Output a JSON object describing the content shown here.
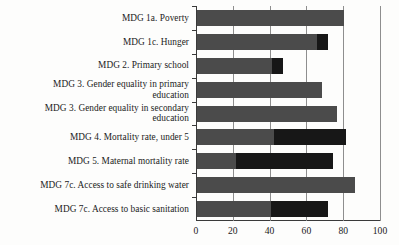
{
  "chart_data": {
    "type": "bar",
    "orientation": "horizontal",
    "title": "",
    "xlabel": "",
    "ylabel": "",
    "xlim": [
      0,
      100
    ],
    "xticks": [
      0,
      20,
      40,
      60,
      80,
      100
    ],
    "xtick_labels": [
      "0",
      "20",
      "40",
      "60",
      "80",
      "100"
    ],
    "grid": true,
    "grid_axis": "x",
    "legend": "none",
    "categories": [
      "MDG 1a. Poverty",
      "MDG 1c. Hunger",
      "MDG 2. Primary school",
      "MDG 3. Gender equality in primary education",
      "MDG 3. Gender equality in secondary education",
      "MDG 4. Mortality rate, under 5",
      "MDG 5. Maternal mortality rate",
      "MDG 7c. Access to safe drinking water",
      "MDG 7c. Access to basic sanitation"
    ],
    "series": [
      {
        "name": "base",
        "color": "#4b4b4b",
        "values": [
          80,
          65,
          41,
          68,
          76,
          42,
          21,
          86,
          40
        ]
      },
      {
        "name": "highlight",
        "color": "#171717",
        "values": [
          0,
          6,
          6,
          0,
          0,
          39,
          53,
          0,
          31
        ]
      }
    ],
    "totals": [
      80,
      71,
      47,
      68,
      76,
      81,
      74,
      86,
      71
    ]
  },
  "labels": {
    "rows": [
      {
        "lines": [
          "MDG 1a. Poverty"
        ]
      },
      {
        "lines": [
          "MDG 1c. Hunger"
        ]
      },
      {
        "lines": [
          "MDG 2. Primary school"
        ]
      },
      {
        "lines": [
          "MDG 3. Gender equality in primary",
          "education"
        ]
      },
      {
        "lines": [
          "MDG 3. Gender equality in secondary",
          "education"
        ]
      },
      {
        "lines": [
          "MDG 4. Mortality rate, under 5"
        ]
      },
      {
        "lines": [
          "MDG 5. Maternal mortality rate"
        ]
      },
      {
        "lines": [
          "MDG 7c. Access to safe drinking water"
        ]
      },
      {
        "lines": [
          "MDG 7c. Access to basic sanitation"
        ]
      }
    ]
  },
  "colors": {
    "base_bar": "#4b4b4b",
    "highlight_bar": "#171717",
    "gridline": "#8e8e8e",
    "axis": "#3a3a3a",
    "text": "#1b1b1b",
    "background": "#fdfdfc"
  }
}
